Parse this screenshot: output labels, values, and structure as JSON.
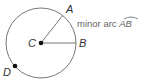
{
  "diagram": {
    "circle": {
      "center_label": "C",
      "cx": 41,
      "cy": 43,
      "r": 36
    },
    "points": [
      {
        "label": "A",
        "x": 63,
        "y": 14
      },
      {
        "label": "B",
        "x": 77,
        "y": 43
      },
      {
        "label": "D",
        "x": 16,
        "y": 69
      }
    ],
    "annotation": {
      "text": "minor arc ",
      "arc_name": "AB"
    },
    "colors": {
      "stroke": "#777777",
      "point": "#111111",
      "text": "#333333"
    }
  }
}
